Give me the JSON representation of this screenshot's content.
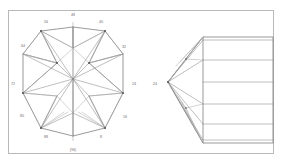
{
  "figure": {
    "view_left": "crown-view",
    "view_right": "profile-view",
    "frame": {
      "x": 8,
      "y": 10,
      "width": 266,
      "height": 144,
      "color": "#b9b9b9"
    },
    "line_color": "#8a8a8a",
    "outline_color": "#6f6f6f",
    "label_color": "#6a6a6a",
    "background": "#ffffff"
  },
  "crown_view": {
    "name": "crown-view",
    "center": {
      "x": 73,
      "y": 79
    },
    "outline_points": "73,27 105,31 123,54 123,92 105,128 73,136 41,128 23,92 23,54 41,31",
    "labels": [
      {
        "text": "48",
        "x": 73,
        "y": 15
      },
      {
        "text": "56",
        "x": 46,
        "y": 22
      },
      {
        "text": "40",
        "x": 101,
        "y": 22
      },
      {
        "text": "64",
        "x": 23,
        "y": 46
      },
      {
        "text": "32",
        "x": 124,
        "y": 47
      },
      {
        "text": "72",
        "x": 13,
        "y": 84
      },
      {
        "text": "24",
        "x": 134,
        "y": 84
      },
      {
        "text": "80",
        "x": 22,
        "y": 116
      },
      {
        "text": "16",
        "x": 125,
        "y": 117
      },
      {
        "text": "88",
        "x": 46,
        "y": 137
      },
      {
        "text": "8",
        "x": 101,
        "y": 137
      },
      {
        "text": "(96)",
        "x": 73,
        "y": 150
      }
    ]
  },
  "profile_view": {
    "name": "profile-view",
    "label": "24",
    "apex": {
      "x": 168,
      "y": 82
    },
    "girdle_left": {
      "x": 203,
      "y": 37
    }
  }
}
